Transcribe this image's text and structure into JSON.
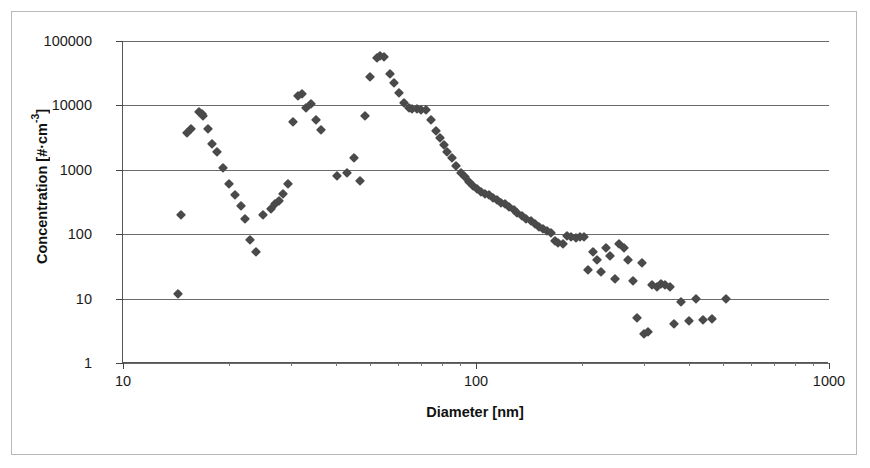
{
  "axes": {
    "x_title": "Diameter [nm]",
    "y_title_prefix": "Concentration [#·cm",
    "y_title_exp": "-3",
    "y_title_suffix": "]",
    "x_ticks": [
      "10",
      "100",
      "1000"
    ],
    "y_ticks": [
      "100000",
      "10000",
      "1000",
      "100",
      "10",
      "1"
    ]
  },
  "chart_data": {
    "type": "scatter",
    "title": "",
    "xlabel": "Diameter [nm]",
    "ylabel": "Concentration [#·cm-3]",
    "xscale": "log",
    "yscale": "log",
    "xlim": [
      10,
      1000
    ],
    "ylim": [
      1,
      100000
    ],
    "grid": true,
    "legend": false,
    "marker": "diamond",
    "marker_color": "#4a4a4a",
    "series": [
      {
        "name": "Particle number concentration",
        "points": [
          [
            14.3,
            12
          ],
          [
            14.6,
            200
          ],
          [
            15.2,
            3700
          ],
          [
            15.6,
            4300
          ],
          [
            16.4,
            7800
          ],
          [
            16.7,
            7400
          ],
          [
            16.9,
            6900
          ],
          [
            17.4,
            4300
          ],
          [
            17.9,
            2500
          ],
          [
            18.5,
            1900
          ],
          [
            19.2,
            1050
          ],
          [
            20.0,
            610
          ],
          [
            20.8,
            400
          ],
          [
            21.6,
            270
          ],
          [
            22.2,
            175
          ],
          [
            22.9,
            80
          ],
          [
            23.8,
            52
          ],
          [
            25.0,
            200
          ],
          [
            26.2,
            250
          ],
          [
            26.9,
            290
          ],
          [
            27.6,
            330
          ],
          [
            28.4,
            420
          ],
          [
            29.4,
            600
          ],
          [
            30.4,
            5500
          ],
          [
            31.4,
            14000
          ],
          [
            32.2,
            15000
          ],
          [
            33.0,
            9000
          ],
          [
            34.0,
            10500
          ],
          [
            35.2,
            6000
          ],
          [
            36.3,
            4100
          ],
          [
            40.5,
            800
          ],
          [
            43.0,
            900
          ],
          [
            45.0,
            1500
          ],
          [
            47.0,
            680
          ],
          [
            48.5,
            6800
          ],
          [
            50.0,
            28000
          ],
          [
            52.5,
            55000
          ],
          [
            53.5,
            58000
          ],
          [
            55.0,
            56000
          ],
          [
            57.0,
            31000
          ],
          [
            58.5,
            22000
          ],
          [
            60.5,
            15500
          ],
          [
            62.5,
            11000
          ],
          [
            64.5,
            9200
          ],
          [
            66.0,
            8900
          ],
          [
            68.0,
            8700
          ],
          [
            70.0,
            8600
          ],
          [
            72.0,
            8400
          ],
          [
            74.5,
            6000
          ],
          [
            77.0,
            4000
          ],
          [
            79.0,
            3100
          ],
          [
            81.0,
            2400
          ],
          [
            83.0,
            1900
          ],
          [
            85.5,
            1500
          ],
          [
            88.0,
            1150
          ],
          [
            90.5,
            900
          ],
          [
            93.0,
            760
          ],
          [
            95.5,
            650
          ],
          [
            98.0,
            560
          ],
          [
            100.5,
            500
          ],
          [
            103.0,
            460
          ],
          [
            106.0,
            420
          ],
          [
            109.0,
            400
          ],
          [
            112.0,
            370
          ],
          [
            115.0,
            340
          ],
          [
            118.0,
            310
          ],
          [
            121.0,
            290
          ],
          [
            124.0,
            260
          ],
          [
            128.0,
            240
          ],
          [
            131.0,
            215
          ],
          [
            135.0,
            190
          ],
          [
            139.0,
            175
          ],
          [
            143.0,
            160
          ],
          [
            147.0,
            145
          ],
          [
            151.0,
            130
          ],
          [
            155.0,
            120
          ],
          [
            159.0,
            112
          ],
          [
            163.0,
            105
          ],
          [
            167.0,
            78
          ],
          [
            171.0,
            72
          ],
          [
            176.0,
            70
          ],
          [
            181.0,
            95
          ],
          [
            186.0,
            90
          ],
          [
            192.0,
            88
          ],
          [
            197.0,
            90
          ],
          [
            202.0,
            92
          ],
          [
            208.0,
            28
          ],
          [
            214.0,
            52
          ],
          [
            220.0,
            40
          ],
          [
            226.0,
            26
          ],
          [
            233.0,
            60
          ],
          [
            240.0,
            46
          ],
          [
            247.0,
            20
          ],
          [
            254.0,
            70
          ],
          [
            262.0,
            62
          ],
          [
            270.0,
            40
          ],
          [
            278.0,
            19
          ],
          [
            286.0,
            5
          ],
          [
            295.0,
            36
          ],
          [
            300.0,
            2.8
          ],
          [
            308.0,
            3.0
          ],
          [
            316.0,
            16
          ],
          [
            325.0,
            15
          ],
          [
            334.0,
            17
          ],
          [
            344.0,
            16
          ],
          [
            354.0,
            15
          ],
          [
            365.0,
            4
          ],
          [
            380.0,
            9
          ],
          [
            400.0,
            4.5
          ],
          [
            420.0,
            10
          ],
          [
            440.0,
            4.7
          ],
          [
            465.0,
            4.8
          ],
          [
            510.0,
            10
          ]
        ]
      }
    ]
  }
}
